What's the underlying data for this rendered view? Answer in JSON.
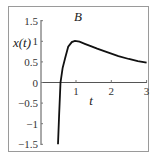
{
  "chart_data": {
    "type": "line",
    "title": "B",
    "xlabel": "t",
    "ylabel": "x(t)",
    "xlim": [
      0,
      3
    ],
    "ylim": [
      -1.5,
      1.5
    ],
    "xticks": [
      "1",
      "2",
      "3"
    ],
    "yticks": [
      "1.5",
      "1",
      "0.5",
      "0",
      "−0.5",
      "−1",
      "−1.5"
    ],
    "grid": false,
    "legend": null,
    "series": [
      {
        "name": "x(t)",
        "x": [
          0.49,
          0.52,
          0.56,
          0.62,
          0.69,
          0.78,
          0.88,
          0.97,
          1.1,
          1.25,
          1.4,
          1.6,
          1.8,
          1.96,
          2.2,
          2.5,
          2.75,
          3.0
        ],
        "y": [
          -1.5,
          -0.8,
          0.0,
          0.35,
          0.59,
          0.87,
          0.98,
          1.01,
          0.99,
          0.94,
          0.89,
          0.82,
          0.76,
          0.71,
          0.64,
          0.57,
          0.52,
          0.48
        ]
      }
    ],
    "color": "#111111"
  },
  "labels": {
    "title": "B",
    "xlabel": "t",
    "ylabel": "x(t)"
  }
}
